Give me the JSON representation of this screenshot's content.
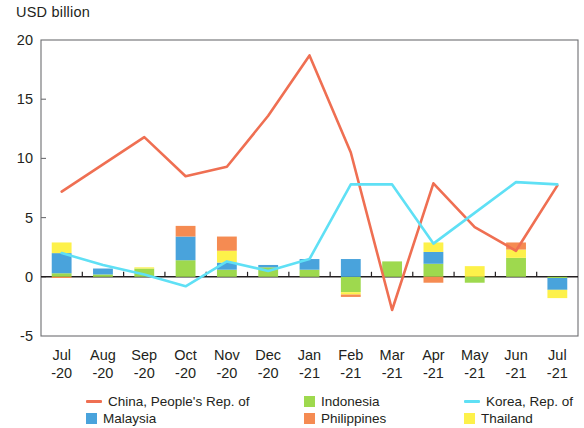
{
  "axis_title": "USD billion",
  "legend": {
    "rows": [
      [
        {
          "name": "china",
          "label": "China, People's Rep. of",
          "marker": "line",
          "color": "#ef6f52"
        },
        {
          "name": "indonesia",
          "label": "Indonesia",
          "marker": "box",
          "color": "#9ed94e"
        },
        {
          "name": "korea",
          "label": "Korea, Rep. of",
          "marker": "line",
          "color": "#5fe0f5"
        }
      ],
      [
        {
          "name": "malaysia",
          "label": "Malaysia",
          "marker": "box",
          "color": "#49a3dc"
        },
        {
          "name": "philippines",
          "label": "Philippines",
          "marker": "box",
          "color": "#f58b52"
        },
        {
          "name": "thailand",
          "label": "Thailand",
          "marker": "box",
          "color": "#fdf14a"
        }
      ]
    ]
  },
  "chart_data": {
    "type": "bar",
    "title": "",
    "subtitle": "",
    "xlabel": "",
    "ylabel": "USD billion",
    "ylim": [
      -5,
      20
    ],
    "yticks": [
      20,
      15,
      10,
      5,
      0,
      -5
    ],
    "ytick_labels": [
      "20",
      "15",
      "10",
      "5",
      "0",
      "-5"
    ],
    "grid": false,
    "legend_position": "bottom",
    "categories": [
      "Jul\n-20",
      "Aug\n-20",
      "Sep\n-20",
      "Oct\n-20",
      "Nov\n-20",
      "Dec\n-20",
      "Jan\n-21",
      "Feb\n-21",
      "Mar\n-21",
      "Apr\n-21",
      "May\n-21",
      "Jun\n-21",
      "Jul\n-21"
    ],
    "category_labels_top": [
      "Jul",
      "Aug",
      "Sep",
      "Oct",
      "Nov",
      "Dec",
      "Jan",
      "Feb",
      "Mar",
      "Apr",
      "May",
      "Jun",
      "Jul"
    ],
    "category_labels_bottom": [
      "-20",
      "-20",
      "-20",
      "-20",
      "-20",
      "-20",
      "-21",
      "-21",
      "-21",
      "-21",
      "-21",
      "-21",
      "-21"
    ],
    "stacked": true,
    "bar_series": [
      {
        "name": "Indonesia",
        "color": "#9ed94e",
        "values": [
          0.3,
          0.2,
          0.7,
          1.4,
          0.6,
          0.8,
          0.6,
          -1.3,
          1.3,
          1.1,
          -0.5,
          1.6,
          -0.1
        ]
      },
      {
        "name": "Malaysia",
        "color": "#49a3dc",
        "values": [
          1.7,
          0.5,
          0.0,
          2.0,
          0.6,
          0.2,
          0.9,
          1.5,
          0.0,
          1.0,
          0.0,
          0.0,
          -1.0
        ]
      },
      {
        "name": "Thailand",
        "color": "#fdf14a",
        "values": [
          0.9,
          0.0,
          0.1,
          0.0,
          1.0,
          0.0,
          0.0,
          -0.2,
          0.0,
          0.8,
          0.9,
          0.7,
          -0.7
        ]
      },
      {
        "name": "Philippines",
        "color": "#f58b52",
        "values": [
          -0.1,
          0.0,
          0.0,
          0.9,
          1.2,
          0.0,
          0.0,
          -0.2,
          0.0,
          -0.5,
          0.0,
          0.6,
          0.0
        ]
      }
    ],
    "line_series": [
      {
        "name": "China, People's Rep. of",
        "color": "#ef6f52",
        "values": [
          7.2,
          9.5,
          11.8,
          8.5,
          9.3,
          13.6,
          18.7,
          10.5,
          -2.8,
          7.9,
          4.2,
          2.2,
          7.7
        ]
      },
      {
        "name": "Korea, Rep. of",
        "color": "#5fe0f5",
        "values": [
          2.0,
          1.0,
          0.2,
          -0.8,
          1.3,
          0.5,
          1.5,
          7.8,
          7.8,
          2.8,
          5.4,
          8.0,
          7.8
        ]
      }
    ]
  }
}
